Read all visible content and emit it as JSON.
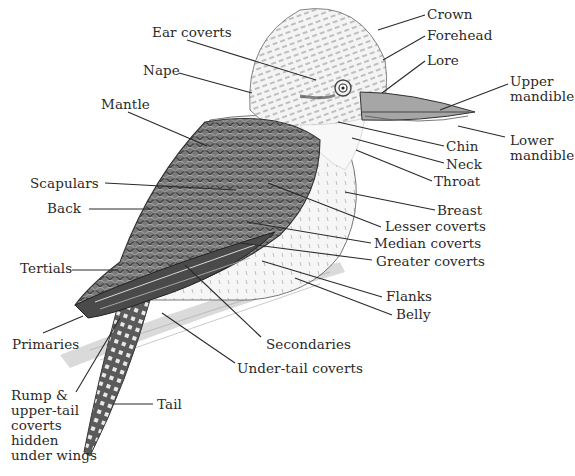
{
  "diagram": {
    "ink_color": "#2a2a2a",
    "background": "#ffffff",
    "labels": [
      {
        "id": "crown",
        "text": "Crown",
        "x": 427,
        "y": 7,
        "line": [
          425,
          15,
          378,
          30
        ]
      },
      {
        "id": "forehead",
        "text": "Forehead",
        "x": 427,
        "y": 28,
        "line": [
          425,
          36,
          383,
          60
        ]
      },
      {
        "id": "lore",
        "text": "Lore",
        "x": 427,
        "y": 53,
        "line": [
          425,
          61,
          382,
          93
        ]
      },
      {
        "id": "upper-mandible",
        "text": "Upper\nmandible",
        "x": 510,
        "y": 74,
        "line": [
          508,
          84,
          440,
          110
        ]
      },
      {
        "id": "lower-mandible",
        "text": "Lower\nmandible",
        "x": 510,
        "y": 133,
        "line": [
          505,
          137,
          458,
          126
        ]
      },
      {
        "id": "ear-coverts",
        "text": "Ear coverts",
        "x": 152,
        "y": 25,
        "line": [
          187,
          40,
          316,
          80
        ]
      },
      {
        "id": "nape",
        "text": "Nape",
        "x": 143,
        "y": 63,
        "line": [
          179,
          73,
          252,
          93
        ]
      },
      {
        "id": "mantle",
        "text": "Mantle",
        "x": 101,
        "y": 97,
        "line": [
          128,
          112,
          207,
          146
        ]
      },
      {
        "id": "chin",
        "text": "Chin",
        "x": 446,
        "y": 139,
        "line": [
          444,
          146,
          338,
          122
        ]
      },
      {
        "id": "neck",
        "text": "Neck",
        "x": 446,
        "y": 157,
        "line": [
          444,
          163,
          352,
          138
        ]
      },
      {
        "id": "throat",
        "text": "Throat",
        "x": 434,
        "y": 174,
        "line": [
          432,
          181,
          356,
          150
        ]
      },
      {
        "id": "scapulars",
        "text": "Scapulars",
        "x": 30,
        "y": 176,
        "line": [
          105,
          183,
          236,
          190
        ]
      },
      {
        "id": "back",
        "text": "Back",
        "x": 47,
        "y": 201,
        "line": [
          89,
          209,
          150,
          209
        ]
      },
      {
        "id": "breast",
        "text": "Breast",
        "x": 437,
        "y": 203,
        "line": [
          435,
          210,
          345,
          192
        ]
      },
      {
        "id": "lesser-coverts",
        "text": "Lesser coverts",
        "x": 385,
        "y": 219,
        "line": [
          381,
          227,
          268,
          183
        ]
      },
      {
        "id": "median-coverts",
        "text": "Median coverts",
        "x": 374,
        "y": 236,
        "line": [
          371,
          243,
          247,
          222
        ]
      },
      {
        "id": "greater-coverts",
        "text": "Greater coverts",
        "x": 376,
        "y": 254,
        "line": [
          372,
          260,
          240,
          243
        ]
      },
      {
        "id": "tertials",
        "text": "Tertials",
        "x": 20,
        "y": 261,
        "line": [
          72,
          270,
          118,
          270
        ]
      },
      {
        "id": "flanks",
        "text": "Flanks",
        "x": 386,
        "y": 289,
        "line": [
          382,
          297,
          262,
          261
        ]
      },
      {
        "id": "belly",
        "text": "Belly",
        "x": 396,
        "y": 307,
        "line": [
          392,
          315,
          295,
          278
        ]
      },
      {
        "id": "primaries",
        "text": "Primaries",
        "x": 12,
        "y": 337,
        "line": [
          43,
          333,
          83,
          316
        ]
      },
      {
        "id": "secondaries",
        "text": "Secondaries",
        "x": 266,
        "y": 337,
        "line": [
          261,
          337,
          185,
          265
        ]
      },
      {
        "id": "under-tail-coverts",
        "text": "Under-tail coverts",
        "x": 237,
        "y": 361,
        "line": [
          235,
          363,
          162,
          313
        ]
      },
      {
        "id": "tail",
        "text": "Tail",
        "x": 157,
        "y": 397,
        "line": [
          153,
          404,
          113,
          404
        ]
      },
      {
        "id": "rump",
        "text": "Rump &\nupper-tail\ncoverts\nhidden\nunder wings",
        "x": 11,
        "y": 388,
        "line": [
          76,
          392,
          120,
          318
        ]
      }
    ]
  }
}
